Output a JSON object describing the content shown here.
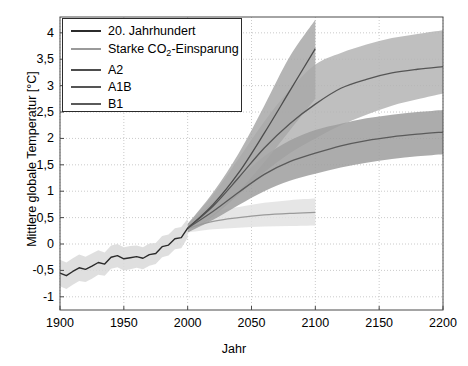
{
  "chart_data": {
    "type": "line",
    "title": "",
    "xlabel": "Jahr",
    "ylabel": "Mittlere globale Temperatur [°C]",
    "xlim": [
      1900,
      2200
    ],
    "ylim": [
      -1.25,
      4.3
    ],
    "xticks": [
      1900,
      1950,
      2000,
      2050,
      2100,
      2150,
      2200
    ],
    "xticklabels": [
      "1900",
      "1950",
      "2000",
      "2050",
      "2100",
      "2150",
      "2200"
    ],
    "yticks": [
      -1,
      -0.5,
      0,
      0.5,
      1,
      1.5,
      2,
      2.5,
      3,
      3.5,
      4
    ],
    "yticklabels": [
      "-1",
      "-0,5",
      "0",
      "0,5",
      "1",
      "1,5",
      "2",
      "2,5",
      "3",
      "3,5",
      "4"
    ],
    "grid": true,
    "grid_style": "dotted",
    "legend_position": "upper left",
    "series": [
      {
        "name": "20. Jahrhundert",
        "color": "#2b2b2b",
        "band_color": "#d9d9d9",
        "x": [
          1900,
          1905,
          1910,
          1915,
          1920,
          1925,
          1930,
          1935,
          1940,
          1945,
          1950,
          1955,
          1960,
          1965,
          1970,
          1975,
          1980,
          1985,
          1990,
          1995,
          2000
        ],
        "values": [
          -0.55,
          -0.6,
          -0.52,
          -0.45,
          -0.48,
          -0.42,
          -0.35,
          -0.38,
          -0.25,
          -0.22,
          -0.28,
          -0.26,
          -0.24,
          -0.27,
          -0.2,
          -0.18,
          -0.05,
          -0.02,
          0.1,
          0.12,
          0.3
        ],
        "band_lower": [
          -0.8,
          -0.85,
          -0.77,
          -0.7,
          -0.72,
          -0.66,
          -0.58,
          -0.6,
          -0.47,
          -0.44,
          -0.5,
          -0.48,
          -0.45,
          -0.48,
          -0.41,
          -0.38,
          -0.25,
          -0.22,
          -0.1,
          -0.08,
          0.12
        ],
        "band_upper": [
          -0.3,
          -0.35,
          -0.27,
          -0.2,
          -0.24,
          -0.18,
          -0.12,
          -0.16,
          -0.03,
          0.0,
          -0.06,
          -0.04,
          -0.03,
          -0.06,
          0.01,
          0.02,
          0.15,
          0.18,
          0.3,
          0.32,
          0.48
        ]
      },
      {
        "name": "Starke CO2-Einsparung",
        "color": "#9a9a9a",
        "band_color": "#e2e2e2",
        "x": [
          2000,
          2020,
          2040,
          2060,
          2080,
          2100
        ],
        "values": [
          0.3,
          0.43,
          0.5,
          0.55,
          0.58,
          0.6
        ],
        "band_lower": [
          0.22,
          0.28,
          0.31,
          0.33,
          0.34,
          0.35
        ],
        "band_upper": [
          0.38,
          0.6,
          0.7,
          0.78,
          0.83,
          0.86
        ]
      },
      {
        "name": "A2",
        "color": "#4d4d4d",
        "band_color": "#a8a8a8",
        "x": [
          2000,
          2020,
          2040,
          2060,
          2080,
          2100
        ],
        "values": [
          0.3,
          0.75,
          1.35,
          2.1,
          2.9,
          3.7
        ],
        "band_lower": [
          0.22,
          0.55,
          1.0,
          1.55,
          2.15,
          2.75
        ],
        "band_upper": [
          0.38,
          0.98,
          1.72,
          2.62,
          3.55,
          4.25
        ]
      },
      {
        "name": "A1B",
        "color": "#555555",
        "band_color": "#b4b4b4",
        "x": [
          2000,
          2020,
          2040,
          2060,
          2080,
          2100,
          2120,
          2140,
          2160,
          2180,
          2200
        ],
        "values": [
          0.3,
          0.72,
          1.26,
          1.82,
          2.28,
          2.65,
          2.95,
          3.12,
          3.24,
          3.31,
          3.36
        ],
        "band_lower": [
          0.22,
          0.53,
          0.94,
          1.36,
          1.72,
          2.0,
          2.25,
          2.45,
          2.62,
          2.74,
          2.85
        ],
        "band_upper": [
          0.38,
          0.94,
          1.62,
          2.32,
          2.92,
          3.4,
          3.62,
          3.78,
          3.9,
          3.98,
          4.05
        ]
      },
      {
        "name": "B1",
        "color": "#5a5a5a",
        "band_color": "#9e9e9e",
        "x": [
          2000,
          2020,
          2040,
          2060,
          2080,
          2100,
          2120,
          2140,
          2160,
          2180,
          2200
        ],
        "values": [
          0.3,
          0.62,
          0.98,
          1.32,
          1.56,
          1.72,
          1.86,
          1.96,
          2.03,
          2.08,
          2.12
        ],
        "band_lower": [
          0.22,
          0.46,
          0.74,
          1.0,
          1.2,
          1.33,
          1.45,
          1.54,
          1.61,
          1.66,
          1.7
        ],
        "band_upper": [
          0.38,
          0.8,
          1.24,
          1.66,
          1.96,
          2.16,
          2.28,
          2.38,
          2.45,
          2.5,
          2.54
        ]
      }
    ]
  },
  "legend": {
    "items": [
      {
        "label": "20. Jahrhundert",
        "color": "#2b2b2b"
      },
      {
        "label_pre": "Starke CO",
        "label_sub": "2",
        "label_post": "-Einsparung",
        "color": "#9a9a9a"
      },
      {
        "label": "A2",
        "color": "#4d4d4d"
      },
      {
        "label": "A1B",
        "color": "#555555"
      },
      {
        "label": "B1",
        "color": "#5a5a5a"
      }
    ]
  }
}
